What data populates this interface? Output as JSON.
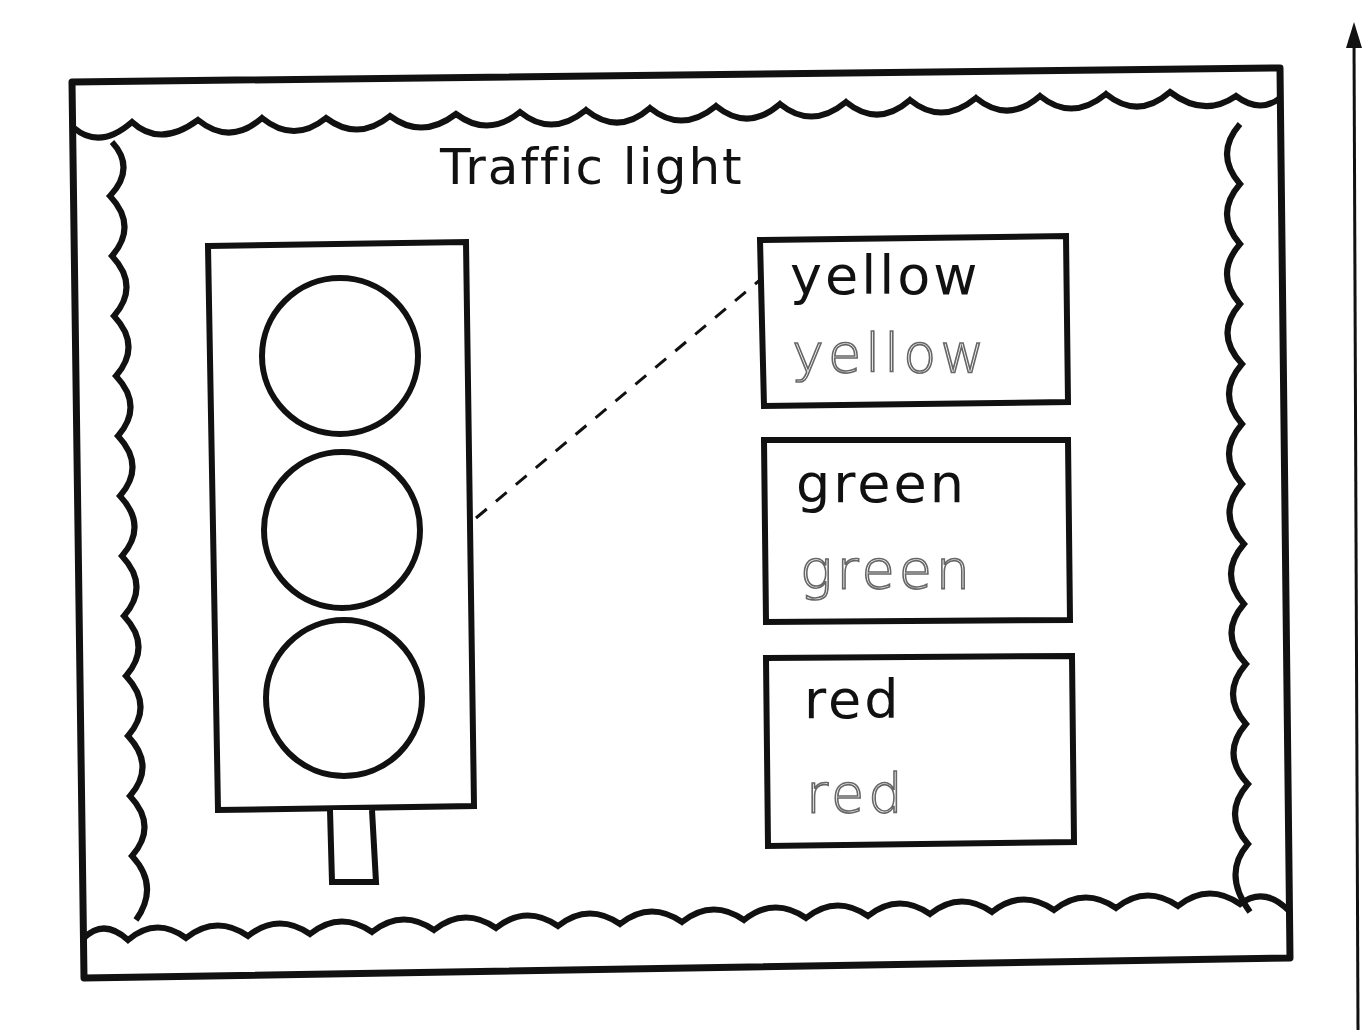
{
  "worksheet": {
    "title": "Traffic light",
    "cards": [
      {
        "word": "yellow",
        "trace": "yellow"
      },
      {
        "word": "green",
        "trace": "green"
      },
      {
        "word": "red",
        "trace": "red"
      }
    ],
    "traffic_light": {
      "lights": 3
    },
    "connector": "dashed line from traffic light to yellow card",
    "margin_arrow": "up-arrow"
  }
}
